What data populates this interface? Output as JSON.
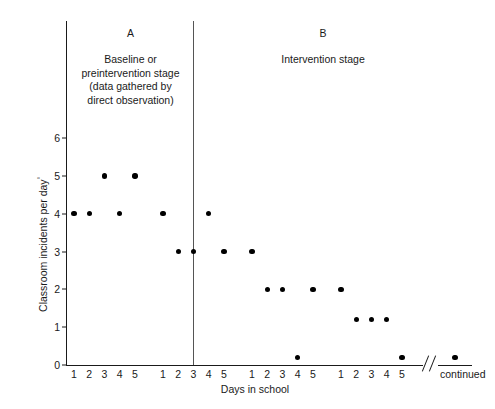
{
  "figure": {
    "x_axis_title": "Days in school",
    "y_axis_title": "Classroom incidents per day",
    "y_axis_title_marker": "°",
    "continued_label": "continued",
    "phase_a": {
      "letter": "A",
      "caption": "Baseline or\npreintervention stage\n(data gathered by\ndirect observation)"
    },
    "phase_b": {
      "letter": "B",
      "caption": "Intervention stage"
    }
  },
  "chart_data": {
    "type": "scatter",
    "title": "",
    "xlabel": "Days in school",
    "ylabel": "Classroom incidents per day",
    "ylim": [
      0,
      6.6
    ],
    "y_ticks": [
      0,
      1,
      2,
      3,
      4,
      5,
      6
    ],
    "y_tick_labels": [
      "0",
      "1",
      "2",
      "3",
      "4",
      "5",
      "6"
    ],
    "x_tick_labels": [
      "1",
      "2",
      "3",
      "4",
      "5",
      "1",
      "2",
      "3",
      "4",
      "5",
      "1",
      "2",
      "3",
      "4",
      "5",
      "1",
      "2",
      "3",
      "4",
      "5"
    ],
    "grid": false,
    "legend": "none",
    "phase_divider_after_index": 7,
    "axis_break_before_last_point": true,
    "series": [
      {
        "name": "Classroom incidents per day",
        "phase_a_points": [
          {
            "index": 0,
            "day_label": "1",
            "value": 4
          },
          {
            "index": 1,
            "day_label": "2",
            "value": 4
          },
          {
            "index": 2,
            "day_label": "3",
            "value": 5
          },
          {
            "index": 3,
            "day_label": "4",
            "value": 4
          },
          {
            "index": 4,
            "day_label": "5",
            "value": 5
          },
          {
            "index": 5,
            "day_label": "1",
            "value": 4
          },
          {
            "index": 6,
            "day_label": "2",
            "value": 3
          },
          {
            "index": 7,
            "day_label": "3",
            "value": 3
          }
        ],
        "phase_b_points": [
          {
            "index": 8,
            "day_label": "4",
            "value": 4
          },
          {
            "index": 9,
            "day_label": "5",
            "value": 3
          },
          {
            "index": 10,
            "day_label": "1",
            "value": 3
          },
          {
            "index": 11,
            "day_label": "2",
            "value": 2
          },
          {
            "index": 12,
            "day_label": "3",
            "value": 2
          },
          {
            "index": 13,
            "day_label": "4",
            "value": 0.2
          },
          {
            "index": 14,
            "day_label": "5",
            "value": 2
          },
          {
            "index": 15,
            "day_label": "1",
            "value": 2
          },
          {
            "index": 16,
            "day_label": "2",
            "value": 1.2
          },
          {
            "index": 17,
            "day_label": "3",
            "value": 1.2
          },
          {
            "index": 18,
            "day_label": "4",
            "value": 1.2
          },
          {
            "index": 19,
            "day_label": "5",
            "value": 0.2
          },
          {
            "index": 20,
            "day_label": "",
            "value": 0.2,
            "after_break": true
          }
        ]
      }
    ]
  }
}
